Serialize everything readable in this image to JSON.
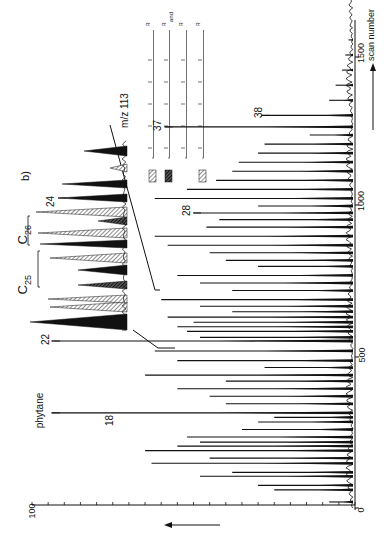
{
  "figure": {
    "panel_label": "b)",
    "orientation": "rotated-90-ccw",
    "ink_color": "#111111",
    "background": "#ffffff"
  },
  "axes": {
    "x": {
      "label": "scan number",
      "ticks": [
        "0",
        "500",
        "1000",
        "1500"
      ],
      "range": [
        0,
        1700
      ],
      "arrow": "right-arrow-icon"
    },
    "y": {
      "ticks": [
        "0",
        "100"
      ],
      "range": [
        0,
        100
      ],
      "arrow": "up-arrow-icon",
      "minor_tick_count": 20
    }
  },
  "annotations": {
    "phytane": "phytane",
    "peak18": "18",
    "peak22": "22",
    "peak24": "24",
    "peak28": "28",
    "peak37": "37",
    "peak38": "38",
    "c25": "C",
    "c25_sub": "25",
    "c26": "C",
    "c26_sub": "26",
    "inset_label": "m/z 113",
    "legend_and": "and",
    "legend_r": "R"
  },
  "legend": [
    {
      "pattern": "light-hatch",
      "structure": "isoprenoid chain - R"
    },
    {
      "pattern": "dark-hatch",
      "structure": "isoprenoid chain - R and isoprenoid chain - R"
    },
    {
      "pattern": "light-hatch",
      "structure": "isoprenoid chain - R"
    }
  ],
  "chart_data": {
    "type": "line",
    "title": "",
    "panel": "b)",
    "xlabel": "scan number",
    "ylabel": "relative intensity",
    "xlim": [
      0,
      1700
    ],
    "ylim": [
      0,
      100
    ],
    "x_ticks": [
      0,
      500,
      1000,
      1500
    ],
    "y_ticks": [
      0,
      100
    ],
    "grid": false,
    "labeled_peaks": [
      {
        "label": "phytane",
        "scan": 315,
        "intensity": 94
      },
      {
        "label": "18",
        "scan": 318,
        "intensity": 62
      },
      {
        "label": "22",
        "scan": 553,
        "intensity": 94
      },
      {
        "label": "28",
        "scan": 977,
        "intensity": 50
      },
      {
        "label": "37",
        "scan": 1262,
        "intensity": 59
      },
      {
        "label": "38",
        "scan": 1300,
        "intensity": 29
      }
    ],
    "peaks": [
      {
        "scan": 20,
        "intensity": 8
      },
      {
        "scan": 60,
        "intensity": 25
      },
      {
        "scan": 75,
        "intensity": 30
      },
      {
        "scan": 105,
        "intensity": 48
      },
      {
        "scan": 118,
        "intensity": 38
      },
      {
        "scan": 148,
        "intensity": 63
      },
      {
        "scan": 165,
        "intensity": 45
      },
      {
        "scan": 190,
        "intensity": 65
      },
      {
        "scan": 205,
        "intensity": 55
      },
      {
        "scan": 218,
        "intensity": 48
      },
      {
        "scan": 235,
        "intensity": 52
      },
      {
        "scan": 260,
        "intensity": 35
      },
      {
        "scan": 285,
        "intensity": 30
      },
      {
        "scan": 300,
        "intensity": 25
      },
      {
        "scan": 315,
        "intensity": 94
      },
      {
        "scan": 345,
        "intensity": 40
      },
      {
        "scan": 370,
        "intensity": 45
      },
      {
        "scan": 395,
        "intensity": 55
      },
      {
        "scan": 420,
        "intensity": 40
      },
      {
        "scan": 440,
        "intensity": 65
      },
      {
        "scan": 465,
        "intensity": 28
      },
      {
        "scan": 488,
        "intensity": 55
      },
      {
        "scan": 520,
        "intensity": 62
      },
      {
        "scan": 553,
        "intensity": 94
      },
      {
        "scan": 565,
        "intensity": 48
      },
      {
        "scan": 585,
        "intensity": 52
      },
      {
        "scan": 600,
        "intensity": 55
      },
      {
        "scan": 615,
        "intensity": 50
      },
      {
        "scan": 632,
        "intensity": 58
      },
      {
        "scan": 650,
        "intensity": 38
      },
      {
        "scan": 668,
        "intensity": 48
      },
      {
        "scan": 690,
        "intensity": 60
      },
      {
        "scan": 720,
        "intensity": 38
      },
      {
        "scan": 745,
        "intensity": 48
      },
      {
        "scan": 770,
        "intensity": 55
      },
      {
        "scan": 800,
        "intensity": 30
      },
      {
        "scan": 820,
        "intensity": 40
      },
      {
        "scan": 845,
        "intensity": 45
      },
      {
        "scan": 870,
        "intensity": 58
      },
      {
        "scan": 900,
        "intensity": 62
      },
      {
        "scan": 930,
        "intensity": 46
      },
      {
        "scan": 955,
        "intensity": 42
      },
      {
        "scan": 977,
        "intensity": 50
      },
      {
        "scan": 1000,
        "intensity": 30
      },
      {
        "scan": 1025,
        "intensity": 62
      },
      {
        "scan": 1055,
        "intensity": 52
      },
      {
        "scan": 1085,
        "intensity": 43
      },
      {
        "scan": 1115,
        "intensity": 38
      },
      {
        "scan": 1145,
        "intensity": 36
      },
      {
        "scan": 1175,
        "intensity": 30
      },
      {
        "scan": 1205,
        "intensity": 28
      },
      {
        "scan": 1235,
        "intensity": 14
      },
      {
        "scan": 1262,
        "intensity": 59
      },
      {
        "scan": 1300,
        "intensity": 29
      },
      {
        "scan": 1350,
        "intensity": 8
      },
      {
        "scan": 1400,
        "intensity": 6
      },
      {
        "scan": 1450,
        "intensity": 4
      },
      {
        "scan": 1500,
        "intensity": 3
      },
      {
        "scan": 1550,
        "intensity": 2
      }
    ],
    "inset": {
      "label": "m/z 113",
      "type": "area",
      "groups": [
        "C25",
        "C26"
      ],
      "labeled_peaks": [
        "24"
      ],
      "patterns": [
        "solid",
        "light-hatch",
        "dark-hatch"
      ]
    }
  }
}
